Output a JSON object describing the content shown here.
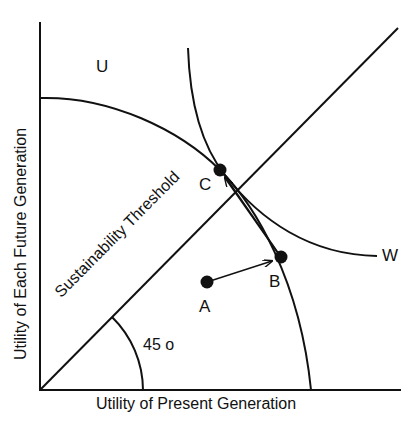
{
  "diagram": {
    "title": "",
    "axes": {
      "x_label": "Utility of Present Generation",
      "y_label": "Utility of Each Future Generation"
    },
    "lines": {
      "sustainability_threshold": "Sustainability Threshold",
      "angle_label": "45 o"
    },
    "curves": {
      "frontier": "U",
      "welfare": "W"
    },
    "points": [
      {
        "id": "A",
        "label": "A"
      },
      {
        "id": "B",
        "label": "B"
      },
      {
        "id": "C",
        "label": "C"
      }
    ],
    "arrows": [
      {
        "from": "A",
        "to": "B"
      },
      {
        "from": "B",
        "to": "C"
      }
    ],
    "colors": {
      "ink": "#111111",
      "background": "#ffffff"
    }
  }
}
